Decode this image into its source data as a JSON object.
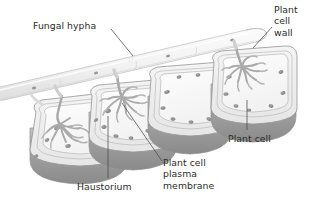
{
  "figure": {
    "width": 310,
    "height": 201,
    "background_color": "#ffffff"
  },
  "labels": {
    "fungal_hypha": "Fungal hypha",
    "plant_cell_wall_line1": "Plant",
    "plant_cell_wall_line2": "cell",
    "plant_cell_wall_line3": "wall",
    "plant_cell": "Plant cell",
    "haustorium": "Haustorium",
    "plasma_membrane_line1": "Plant cell",
    "plasma_membrane_line2": "plasma",
    "plasma_membrane_line3": "membrane"
  },
  "colors": {
    "text": "#2b2b2b",
    "leader_line": "#4a4a4a",
    "cell_outline": "#9a9a9a",
    "cell_wall_fill": "#efefef",
    "cell_interior_fill": "#fafafa",
    "cell_shadow_dark": "#8e8e8e",
    "cell_shadow_mid": "#b4b4b4",
    "hypha_fill": "#f6f6f6",
    "hypha_outline": "#c8c8c8",
    "organelle_fill": "#8c8c8c",
    "haustorium_outline": "#a8a8a8"
  },
  "structures": {
    "hypha": {
      "name": "Fungal hypha",
      "description": "Tubular fungal filament running diagonally above the plant cell row"
    },
    "cells": [
      {
        "name": "plant-cell-1",
        "has_haustorium": true
      },
      {
        "name": "plant-cell-2",
        "has_haustorium": true
      },
      {
        "name": "plant-cell-3",
        "has_haustorium": false
      },
      {
        "name": "plant-cell-4",
        "has_haustorium": true
      }
    ]
  }
}
